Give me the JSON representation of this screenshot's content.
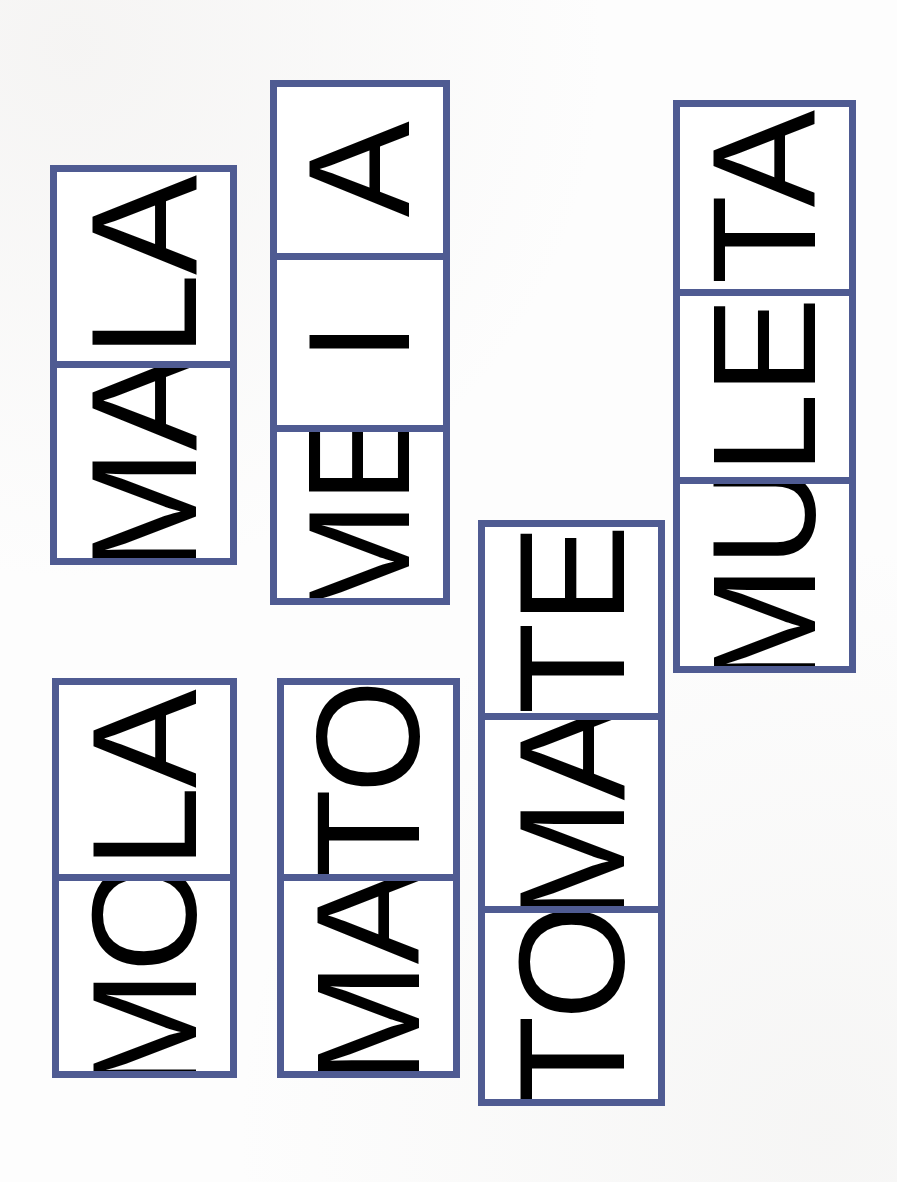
{
  "page": {
    "background_color": "#FDFDFD",
    "width": 897,
    "height": 1182,
    "orientation": "rotated-90-ccw"
  },
  "palette": {
    "frame_blue": "#4F5B92",
    "letter_black": "#111111",
    "letter_orange": "#E6522E",
    "card_white": "#FFFFFF"
  },
  "cards": [
    {
      "id": "card-mala",
      "word": "MALA",
      "cells": [
        {
          "id": "cell-ma",
          "text": "MA",
          "first_letter": "M",
          "first_color": "#111111",
          "second_letter": "A",
          "second_color": "#E6522E"
        },
        {
          "id": "cell-la",
          "text": "LA",
          "first_letter": "L",
          "first_color": "#111111",
          "second_letter": "A",
          "second_color": "#E6522E"
        }
      ],
      "x": 50,
      "y": 165,
      "width": 187,
      "height": 400,
      "cell_count": 2
    },
    {
      "id": "card-meia",
      "word": "MEIA",
      "cells": [
        {
          "id": "cell-me",
          "text": "ME",
          "first_letter": "M",
          "first_color": "#111111",
          "second_letter": "E",
          "second_color": "#E6522E"
        },
        {
          "id": "cell-i",
          "text": "I",
          "first_letter": "",
          "first_color": "#111111",
          "second_letter": "I",
          "second_color": "#E6522E"
        },
        {
          "id": "cell-a",
          "text": "A",
          "first_letter": "",
          "first_color": "#111111",
          "second_letter": "A",
          "second_color": "#E6522E"
        }
      ],
      "x": 270,
      "y": 80,
      "width": 180,
      "height": 525,
      "cell_count": 3
    },
    {
      "id": "card-muleta",
      "word": "MULETA",
      "cells": [
        {
          "id": "cell-mu",
          "text": "MU",
          "first_letter": "M",
          "first_color": "#111111",
          "second_letter": "U",
          "second_color": "#E6522E"
        },
        {
          "id": "cell-le",
          "text": "LE",
          "first_letter": "L",
          "first_color": "#111111",
          "second_letter": "E",
          "second_color": "#E6522E"
        },
        {
          "id": "cell-ta",
          "text": "TA",
          "first_letter": "T",
          "first_color": "#111111",
          "second_letter": "A",
          "second_color": "#E6522E"
        }
      ],
      "x": 673,
      "y": 100,
      "width": 183,
      "height": 573,
      "cell_count": 3
    },
    {
      "id": "card-mola",
      "word": "MOLA",
      "cells": [
        {
          "id": "cell-mo",
          "text": "MO",
          "first_letter": "M",
          "first_color": "#111111",
          "second_letter": "O",
          "second_color": "#E6522E"
        },
        {
          "id": "cell-la2",
          "text": "LA",
          "first_letter": "L",
          "first_color": "#111111",
          "second_letter": "A",
          "second_color": "#E6522E"
        }
      ],
      "x": 52,
      "y": 678,
      "width": 185,
      "height": 400,
      "cell_count": 2
    },
    {
      "id": "card-mato",
      "word": "MATO",
      "cells": [
        {
          "id": "cell-ma2",
          "text": "MA",
          "first_letter": "M",
          "first_color": "#111111",
          "second_letter": "A",
          "second_color": "#E6522E"
        },
        {
          "id": "cell-to",
          "text": "TO",
          "first_letter": "T",
          "first_color": "#111111",
          "second_letter": "O",
          "second_color": "#E6522E"
        }
      ],
      "x": 277,
      "y": 678,
      "width": 183,
      "height": 400,
      "cell_count": 2
    },
    {
      "id": "card-tomate",
      "word": "TOMATE",
      "cells": [
        {
          "id": "cell-to2",
          "text": "TO",
          "first_letter": "T",
          "first_color": "#111111",
          "second_letter": "O",
          "second_color": "#E6522E"
        },
        {
          "id": "cell-ma3",
          "text": "MA",
          "first_letter": "M",
          "first_color": "#111111",
          "second_letter": "A",
          "second_color": "#E6522E"
        },
        {
          "id": "cell-te",
          "text": "TE",
          "first_letter": "T",
          "first_color": "#111111",
          "second_letter": "E",
          "second_color": "#E6522E"
        }
      ],
      "x": 478,
      "y": 520,
      "width": 187,
      "height": 586,
      "cell_count": 3
    }
  ]
}
